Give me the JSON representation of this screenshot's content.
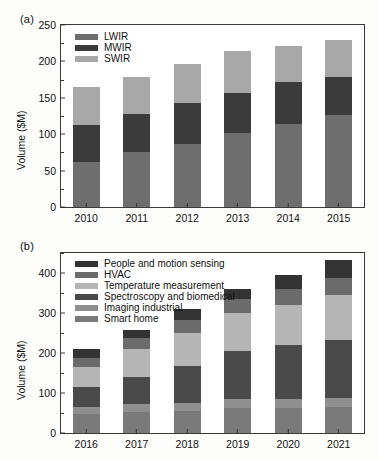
{
  "figure": {
    "background": "#fdfdfb",
    "axis_color": "#3a3a3a"
  },
  "panel_a": {
    "label": "(a)",
    "ylabel": "Volume ($M)",
    "chart_data": {
      "type": "bar",
      "stacked": true,
      "title": "",
      "xlabel": "",
      "ylabel": "Volume ($M)",
      "categories": [
        "2010",
        "2011",
        "2012",
        "2013",
        "2014",
        "2015"
      ],
      "ylim": [
        0,
        250
      ],
      "yticks": [
        0,
        50,
        100,
        150,
        200,
        250
      ],
      "ytick_labels": [
        "0",
        "50",
        "100",
        "150",
        "200",
        "250"
      ],
      "minor_yticks": [
        25,
        75,
        125,
        175,
        225
      ],
      "grid": false,
      "legend_position": "upper left",
      "series": [
        {
          "name": "LWIR",
          "color": "#6e6e6e",
          "values": [
            62,
            75,
            86,
            101,
            114,
            126
          ]
        },
        {
          "name": "MWIR",
          "color": "#3b3b3b",
          "values": [
            50,
            53,
            57,
            55,
            58,
            52
          ]
        },
        {
          "name": "SWIR",
          "color": "#a8a8a8",
          "values": [
            53,
            50,
            53,
            58,
            49,
            51
          ]
        }
      ],
      "stack_order": [
        "LWIR",
        "MWIR",
        "SWIR"
      ],
      "totals": [
        165,
        178,
        196,
        214,
        221,
        229
      ]
    }
  },
  "panel_b": {
    "label": "(b)",
    "ylabel": "Volume ($M)",
    "chart_data": {
      "type": "bar",
      "stacked": true,
      "title": "",
      "xlabel": "",
      "ylabel": "Volume ($M)",
      "categories": [
        "2016",
        "2017",
        "2018",
        "2019",
        "2020",
        "2021"
      ],
      "ylim": [
        0,
        450
      ],
      "yticks": [
        0,
        100,
        200,
        300,
        400
      ],
      "ytick_labels": [
        "0",
        "100",
        "200",
        "300",
        "400"
      ],
      "minor_yticks": [
        50,
        150,
        250,
        350,
        450
      ],
      "grid": false,
      "legend_position": "upper left",
      "series": [
        {
          "name": "Smart home",
          "color": "#7a7a7a",
          "values": [
            47,
            53,
            54,
            63,
            63,
            64
          ]
        },
        {
          "name": "Imaging industrial",
          "color": "#8f8f8f",
          "values": [
            18,
            19,
            21,
            22,
            23,
            24
          ]
        },
        {
          "name": "Spectroscopy and biomedical",
          "color": "#4a4a4a",
          "values": [
            49,
            67,
            92,
            120,
            135,
            145
          ]
        },
        {
          "name": "Temperature measurement",
          "color": "#b5b5b5",
          "values": [
            52,
            72,
            83,
            95,
            100,
            113
          ]
        },
        {
          "name": "HVAC",
          "color": "#6b6b6b",
          "values": [
            22,
            26,
            33,
            35,
            39,
            42
          ]
        },
        {
          "name": "People and motion sensing",
          "color": "#333333",
          "values": [
            21,
            21,
            26,
            26,
            35,
            44
          ]
        }
      ],
      "stack_order": [
        "Smart home",
        "Imaging industrial",
        "Spectroscopy and biomedical",
        "Temperature measurement",
        "HVAC",
        "People and motion sensing"
      ],
      "legend_order": [
        "People and motion sensing",
        "HVAC",
        "Temperature measurement",
        "Spectroscopy and biomedical",
        "Imaging industrial",
        "Smart home"
      ],
      "totals": [
        209,
        258,
        309,
        361,
        395,
        432
      ]
    }
  }
}
